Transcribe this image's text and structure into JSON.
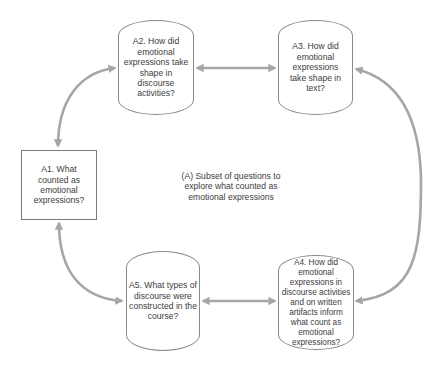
{
  "diagram": {
    "caption": "(A) Subset of questions to explore what counted as emotional expressions",
    "nodes": {
      "a1": {
        "id": "A1",
        "shape": "rectangle",
        "label": "A1. What counted as emotional expressions?"
      },
      "a2": {
        "id": "A2",
        "shape": "barrel",
        "label": "A2. How did emotional expressions take shape in discourse activities?"
      },
      "a3": {
        "id": "A3",
        "shape": "barrel",
        "label": "A3. How did emotional expressions take shape in text?"
      },
      "a4": {
        "id": "A4",
        "shape": "barrel",
        "label": "A4. How did emotional expressions in discourse activities and on written artifacts inform what count as emotional expressions?"
      },
      "a5": {
        "id": "A5",
        "shape": "barrel",
        "label": "A5. What types of discourse were constructed in the course?"
      }
    },
    "edges": [
      {
        "from": "A1",
        "to": "A2",
        "style": "curved",
        "bidirectional": true
      },
      {
        "from": "A2",
        "to": "A3",
        "style": "straight",
        "bidirectional": true
      },
      {
        "from": "A3",
        "to": "A4",
        "style": "curved",
        "bidirectional": true
      },
      {
        "from": "A5",
        "to": "A4",
        "style": "straight",
        "bidirectional": true
      },
      {
        "from": "A1",
        "to": "A5",
        "style": "curved",
        "bidirectional": true
      }
    ],
    "colors": {
      "arrow": "#a6a6a6",
      "node_border": "#8a8a8a",
      "text": "#3c3c3c",
      "background": "#ffffff"
    }
  }
}
